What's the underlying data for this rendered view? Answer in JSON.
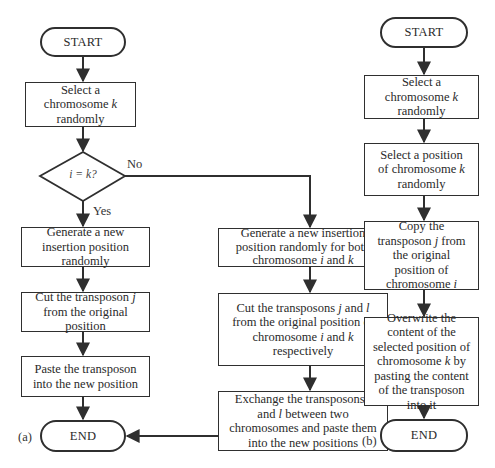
{
  "panel_a": {
    "label": "(a)",
    "start": "START",
    "select_chromosome": [
      "Select a chromosome ",
      "k",
      " randomly"
    ],
    "decision": "i = k?",
    "yes_label": "Yes",
    "no_label": "No",
    "yes_branch": {
      "step1": "Generate a new insertion position randomly",
      "step2": [
        "Cut the transposon ",
        "j",
        " from the original position"
      ],
      "step3": "Paste the transposon into the new position"
    },
    "no_branch": {
      "step1": [
        "Generate a new insertion position randomly for both chromosome ",
        "i",
        " and ",
        "k"
      ],
      "step2": [
        "Cut the transposons ",
        "j",
        " and ",
        "l",
        " from the original position of chromosome ",
        "i",
        " and ",
        "k",
        " respectively"
      ],
      "step3": [
        "Exchange the transposons ",
        "j",
        " and ",
        "l",
        " between two chromosomes and paste them into the new positions"
      ]
    },
    "end": "END"
  },
  "panel_b": {
    "label": "(b)",
    "start": "START",
    "step1": [
      "Select a chromosome ",
      "k",
      " randomly"
    ],
    "step2": [
      "Select a position of chromosome ",
      "k",
      " randomly"
    ],
    "step3": [
      "Copy the transposon ",
      "j",
      " from the original position of chromosome ",
      "i"
    ],
    "step4": [
      "Overwrite the content of the selected position of chromosome ",
      "k",
      " by pasting the content of the transposon into it"
    ],
    "end": "END"
  },
  "colors": {
    "stroke": "#2f2f2f",
    "text": "#2a2a2a",
    "background": "#ffffff"
  }
}
